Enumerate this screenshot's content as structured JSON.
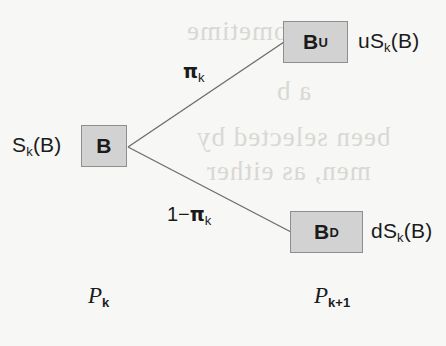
{
  "figure": {
    "type": "binomial-lattice-tree",
    "background_color": "#f7f7f5",
    "node_fill_color": "#d2d2d2",
    "node_border_color": "#8e8e8e",
    "edge_color": "#6e6e6e",
    "text_color": "#1b1b1b"
  },
  "nodes": {
    "root": {
      "label_base": "B",
      "label_sub": "",
      "value_label_base": "S",
      "value_label_sub": "k",
      "value_label_tail": "(B)"
    },
    "up": {
      "label_base": "B",
      "label_sub": "U",
      "value_label_base": "uS",
      "value_label_sub": "k",
      "value_label_tail": "(B)"
    },
    "down": {
      "label_base": "B",
      "label_sub": "D",
      "value_label_base": "dS",
      "value_label_sub": "k",
      "value_label_tail": "(B)"
    }
  },
  "edges": {
    "up_branch": {
      "prefix": "",
      "symbol": "π",
      "sub": "k"
    },
    "down_branch": {
      "prefix": "1−",
      "symbol": "π",
      "sub": "k"
    }
  },
  "periods": {
    "current": {
      "base": "P",
      "sub": "k"
    },
    "next": {
      "base": "P",
      "sub": "k+1"
    }
  },
  "background_bleed": {
    "line1": "sometime",
    "line2": "a b",
    "line3": "been selected by",
    "line4": "men, as either"
  }
}
